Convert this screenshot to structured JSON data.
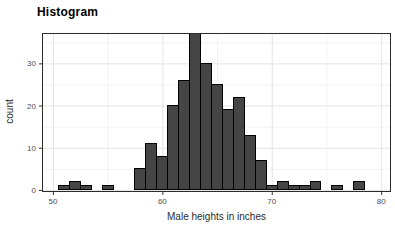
{
  "chart_data": {
    "type": "bar",
    "subtype": "histogram",
    "title": "Histogram",
    "xlabel": "Male heights in inches",
    "ylabel": "count",
    "bins": {
      "center_start": 51,
      "bin_width": 1,
      "counts": [
        1,
        2,
        1,
        0,
        1,
        0,
        0,
        5,
        11,
        8,
        20,
        26,
        37,
        30,
        25,
        19,
        22,
        13,
        7,
        1,
        2,
        1,
        1,
        2,
        0,
        1,
        0,
        2,
        0
      ]
    },
    "x_ticks": [
      50,
      60,
      70,
      80
    ],
    "y_ticks": [
      0,
      10,
      20,
      30
    ],
    "x_minor_ticks": [
      55,
      65,
      75
    ],
    "y_minor_ticks": [
      5,
      15,
      25,
      35
    ],
    "xlim": [
      49.0,
      80.9
    ],
    "ylim": [
      -0.5,
      37.2
    ],
    "grid": true,
    "legend_position": "none",
    "colors": {
      "bar_fill": "#454545",
      "bar_stroke": "#000000",
      "grid_major": "#e4e4e4",
      "grid_minor": "#f2f2f2",
      "panel_border": "#2b2b2b",
      "tick_mark": "#333333",
      "tick_label": "#4d4d4d",
      "background": "#ffffff"
    }
  }
}
